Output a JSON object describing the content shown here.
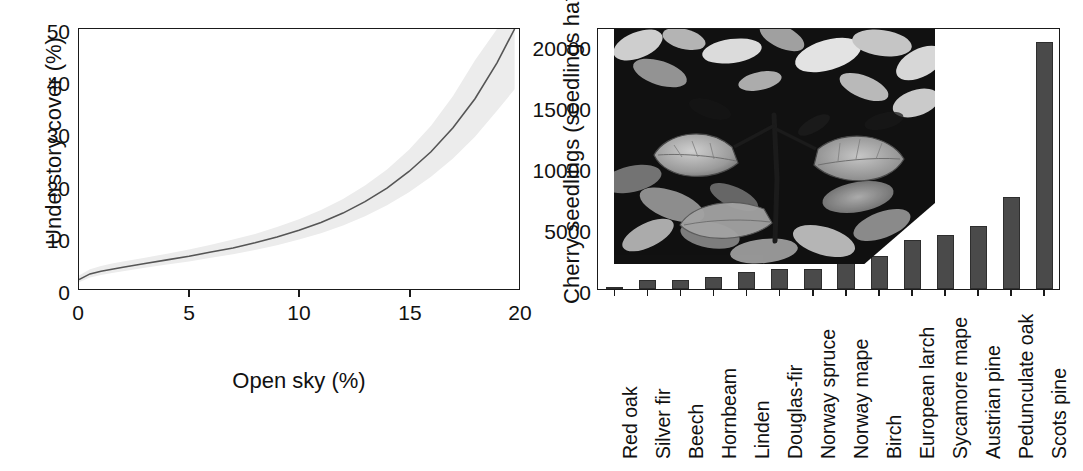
{
  "figure": {
    "panels": [
      "understory-cover-vs-open-sky",
      "cherry-seedlings-by-species"
    ]
  },
  "chart_data": [
    {
      "id": "panel-a",
      "type": "line",
      "title": "",
      "xlabel": "Open sky (%)",
      "ylabel": "Understory cover (%)",
      "xlim": [
        0,
        20
      ],
      "ylim": [
        0,
        50
      ],
      "xticks": [
        0,
        5,
        10,
        15,
        20
      ],
      "yticks": [
        0,
        10,
        20,
        30,
        40,
        50
      ],
      "xtick_labels": [
        "0",
        "5",
        "10",
        "15",
        "20"
      ],
      "ytick_labels": [
        "0",
        "10",
        "20",
        "30",
        "40",
        "50"
      ],
      "grid": false,
      "legend": "none",
      "line_color": "#555555",
      "band_color": "#ececec",
      "series": [
        {
          "name": "Predicted understory cover",
          "x": [
            0,
            0.5,
            1,
            1.5,
            2,
            3,
            4,
            5,
            6,
            7,
            8,
            9,
            10,
            11,
            12,
            13,
            14,
            15,
            16,
            17,
            18,
            19,
            19.8
          ],
          "y": [
            1.8,
            2.9,
            3.4,
            3.8,
            4.2,
            4.9,
            5.6,
            6.3,
            7.1,
            7.9,
            8.9,
            10.0,
            11.3,
            12.8,
            14.6,
            16.8,
            19.4,
            22.6,
            26.4,
            31.0,
            36.6,
            43.5,
            50.0
          ]
        }
      ],
      "confidence_band": {
        "name": "95% confidence interval",
        "lower": [
          1.3,
          2.2,
          2.7,
          3.1,
          3.4,
          4.1,
          4.7,
          5.3,
          6.0,
          6.7,
          7.5,
          8.4,
          9.5,
          10.7,
          12.2,
          14.0,
          16.1,
          18.6,
          21.6,
          25.1,
          29.3,
          34.3,
          38.4
        ],
        "upper": [
          2.6,
          3.8,
          4.4,
          4.9,
          5.3,
          6.0,
          6.8,
          7.6,
          8.5,
          9.5,
          10.6,
          11.9,
          13.4,
          15.2,
          17.3,
          19.9,
          23.0,
          26.8,
          31.4,
          37.1,
          44.0,
          50.0,
          50.0
        ]
      }
    },
    {
      "id": "panel-b",
      "type": "bar",
      "title": "",
      "xlabel": "",
      "ylabel": "Cherry seedlings (seedlings ha",
      "ylabel_exponent": "-1",
      "ylabel_suffix": ")",
      "ylim": [
        0,
        22500
      ],
      "yticks": [
        0,
        5000,
        10000,
        15000,
        20000
      ],
      "ytick_labels": [
        "0",
        "5000",
        "10000",
        "15000",
        "20000"
      ],
      "grid": false,
      "legend": "none",
      "bar_color": "#4a4a4a",
      "bar_edge_color": "#2e2e2e",
      "categories": [
        "Red oak",
        "Silver fir",
        "Beech",
        "Hornbeam",
        "Linden",
        "Douglas-fir",
        "Norway spruce",
        "Norway mape",
        "Birch",
        "European larch",
        "Sycamore mape",
        "Austrian pine",
        "Pedunculate oak",
        "Scots pine"
      ],
      "values": [
        150,
        750,
        780,
        1000,
        1500,
        1700,
        1720,
        2650,
        2800,
        4200,
        4600,
        5450,
        7900,
        21200
      ]
    }
  ],
  "panel_b_inset": {
    "name": "cherry-seedling-photograph",
    "description": "Grayscale photograph of a cherry seedling on forest floor litter"
  }
}
